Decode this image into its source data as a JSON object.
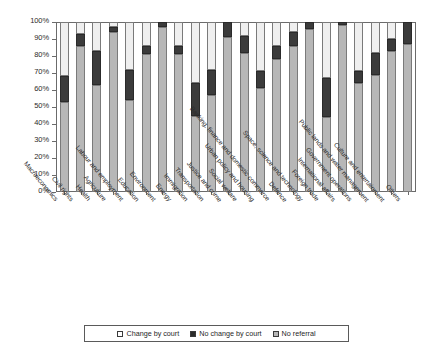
{
  "chart_data": {
    "type": "bar",
    "title": "",
    "subtitle": "",
    "xlabel": "",
    "ylabel": "",
    "ylim": [
      0,
      100
    ],
    "y_tick_labels": [
      "0%",
      "10%",
      "20%",
      "30%",
      "40%",
      "50%",
      "60%",
      "70%",
      "80%",
      "90%",
      "100%"
    ],
    "y_tick_values": [
      0,
      10,
      20,
      30,
      40,
      50,
      60,
      70,
      80,
      90,
      100
    ],
    "stacked": true,
    "stack_order": [
      "No referral",
      "No change by court",
      "Change by court"
    ],
    "grid": false,
    "legend_position": "bottom",
    "categories": [
      "Macroeconomics",
      "Civil rights",
      "Health",
      "Agriculture",
      "Labour and employment",
      "Education",
      "Environment",
      "Energy",
      "Immigration",
      "Transportation",
      "Justice and crime",
      "Social welfare",
      "Urban policy and housing",
      "Banking, finance and domestic commerce",
      "Defence",
      "Space, science and technology",
      "Foreign trade",
      "International affairs",
      "Government operations",
      "Public lands and water management",
      "Culture and entertainment",
      "Others"
    ],
    "series": [
      {
        "name": "No referral",
        "color": "#b7b7b7",
        "values": [
          53,
          86,
          63,
          94,
          54,
          81,
          97,
          81,
          45,
          57,
          91,
          82,
          61,
          78,
          86,
          96,
          44,
          98,
          64,
          69,
          83,
          87
        ]
      },
      {
        "name": "No change by court",
        "color": "#3b3b3b",
        "values": [
          15,
          7,
          20,
          3,
          18,
          5,
          3,
          5,
          19,
          15,
          9,
          10,
          10,
          8,
          8,
          4,
          23,
          2,
          7,
          13,
          7,
          13
        ]
      },
      {
        "name": "Change by court",
        "color": "#efefef",
        "values": [
          32,
          7,
          17,
          3,
          28,
          14,
          0,
          14,
          36,
          28,
          0,
          8,
          29,
          14,
          6,
          0,
          33,
          0,
          29,
          18,
          10,
          0
        ]
      }
    ]
  },
  "legend": {
    "items": [
      {
        "label": "Change by court",
        "swatch": "swatch-white"
      },
      {
        "label": "No change by court",
        "swatch": "swatch-black"
      },
      {
        "label": "No referral",
        "swatch": "swatch-gray"
      }
    ]
  }
}
